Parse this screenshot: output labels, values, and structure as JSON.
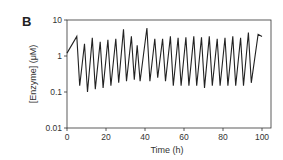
{
  "panel_label": "B",
  "chart_data": {
    "type": "line",
    "title": "",
    "xlabel": "Time  (h)",
    "ylabel": "[Enzyme]  (μM)",
    "xlim": [
      0,
      100
    ],
    "ylim": [
      0.01,
      10
    ],
    "yscale": "log",
    "x_ticks": [
      "0",
      "20",
      "40",
      "60",
      "80",
      "100"
    ],
    "y_ticks": [
      "0.01",
      "0.1",
      "1",
      "10"
    ],
    "grid": false,
    "series": [
      {
        "name": "enzyme",
        "x": [
          0,
          5,
          6.5,
          9,
          10.5,
          13,
          14.5,
          17,
          18.5,
          21,
          22.5,
          25,
          26.5,
          29,
          30.5,
          33,
          34.5,
          36,
          37.5,
          41,
          42.5,
          45,
          46.5,
          49,
          50.5,
          53,
          54.5,
          57,
          58.5,
          61,
          62.5,
          65,
          66.5,
          69,
          70.5,
          73,
          74.5,
          77,
          78.5,
          81,
          82.5,
          85,
          86.5,
          89,
          90.5,
          93,
          94.5,
          98,
          100
        ],
        "y": [
          1.2,
          3.5,
          0.15,
          2.2,
          0.1,
          3.2,
          0.12,
          2.5,
          0.13,
          2.8,
          0.15,
          3.0,
          0.18,
          5.5,
          0.2,
          3.5,
          0.22,
          2.0,
          0.2,
          6.0,
          0.2,
          3.0,
          0.25,
          3.0,
          0.2,
          3.5,
          0.15,
          3.2,
          0.15,
          3.3,
          0.15,
          3.5,
          0.15,
          3.3,
          0.13,
          3.5,
          0.15,
          3.0,
          0.15,
          3.2,
          0.15,
          3.5,
          0.15,
          3.2,
          0.15,
          4.5,
          0.18,
          4.0,
          3.5
        ]
      }
    ]
  }
}
